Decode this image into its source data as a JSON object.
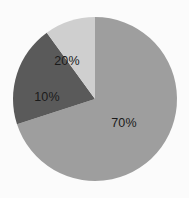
{
  "chart_data": {
    "type": "pie",
    "title": "",
    "subtitle": "",
    "xlabel": "",
    "ylabel": "",
    "grid": false,
    "legend": "none",
    "background_color": "#fbfbfb",
    "center": [
      95,
      99
    ],
    "radius": 82,
    "start_angle_deg": 0,
    "direction": "clockwise",
    "categories": [
      "70%",
      "20%",
      "10%"
    ],
    "values": [
      70,
      20,
      10
    ],
    "labels": [
      "70%",
      "20%",
      "10%"
    ],
    "label_color": "#1a1a1a",
    "colors": [
      "#9e9e9e",
      "#5a5a5a",
      "#cfcfcf"
    ],
    "slices": [
      {
        "label": "70%",
        "value": 70,
        "color": "#9e9e9e",
        "start_angle_deg": 0,
        "end_angle_deg": 252
      },
      {
        "label": "20%",
        "value": 20,
        "color": "#5a5a5a",
        "start_angle_deg": 252,
        "end_angle_deg": 324
      },
      {
        "label": "10%",
        "value": 10,
        "color": "#cfcfcf",
        "start_angle_deg": 324,
        "end_angle_deg": 360
      }
    ]
  }
}
